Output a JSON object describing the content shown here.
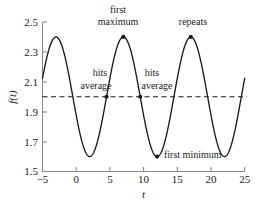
{
  "chart_data": {
    "type": "line",
    "title": "",
    "xlabel": "t",
    "ylabel": "f(t)",
    "xlim": [
      -5,
      25
    ],
    "ylim": [
      1.5,
      2.5
    ],
    "xticks": [
      -5,
      0,
      5,
      10,
      15,
      20,
      25
    ],
    "xtick_labels": [
      "−5",
      "0",
      "5",
      "10",
      "15",
      "20",
      "25"
    ],
    "yticks": [
      1.5,
      1.7,
      1.9,
      2.1,
      2.3,
      2.5
    ],
    "ytick_labels": [
      "1.5",
      "1.7",
      "1.9",
      "2.1",
      "2.3",
      "2.5"
    ],
    "grid": false,
    "legend": "none",
    "series": [
      {
        "name": "f(t)",
        "form": "f(t) = 2.0 + 0.4*cos(2*pi*(t + 3)/10)",
        "midline": 2.0,
        "amplitude": 0.4,
        "period": 10,
        "phase_peak_t": -3,
        "x": [
          -5,
          -4,
          -3,
          -2,
          -1,
          0,
          1,
          2,
          3,
          4,
          5,
          6,
          7,
          8,
          9,
          10,
          11,
          12,
          13,
          14,
          15,
          16,
          17,
          18,
          19,
          20,
          21,
          22,
          23,
          24,
          25
        ],
        "y": [
          2.12,
          2.32,
          2.4,
          2.32,
          2.12,
          1.88,
          1.68,
          1.6,
          1.68,
          1.88,
          2.12,
          2.32,
          2.4,
          2.32,
          2.12,
          1.88,
          1.68,
          1.6,
          1.68,
          1.88,
          2.12,
          2.32,
          2.4,
          2.32,
          2.12,
          1.88,
          1.68,
          1.6,
          1.68,
          1.88,
          2.12
        ]
      },
      {
        "name": "average",
        "style": "dashed-horizontal",
        "value": 2.0
      }
    ],
    "annotations": [
      {
        "id": "first-maximum",
        "label": "first\nmaximum",
        "label_line1": "first",
        "label_line2": "maximum",
        "point_x": 7,
        "point_y": 2.4,
        "marker": true
      },
      {
        "id": "repeats",
        "label": "repeats",
        "label_line1": "repeats",
        "point_x": 17,
        "point_y": 2.4,
        "marker": true
      },
      {
        "id": "hits-average-1",
        "label": "hits\naverage",
        "label_line1": "hits",
        "label_line2": "average",
        "point_x": 4.5,
        "point_y": 2.0,
        "marker": true
      },
      {
        "id": "hits-average-2",
        "label": "hits\naverage",
        "label_line1": "hits",
        "label_line2": "average",
        "point_x": 9.5,
        "point_y": 2.0,
        "marker": true
      },
      {
        "id": "first-minimum",
        "label": "first minimum",
        "label_line1": "first minimum",
        "point_x": 12,
        "point_y": 1.6,
        "marker": true
      }
    ]
  },
  "axes": {
    "x_title": "t",
    "y_title": "f(t)"
  },
  "colors": {
    "curve": "#1a1a1a",
    "axis": "#8a8a8a",
    "average_line": "#1a1a1a",
    "text": "#1a1a1a",
    "background": "#ffffff"
  }
}
